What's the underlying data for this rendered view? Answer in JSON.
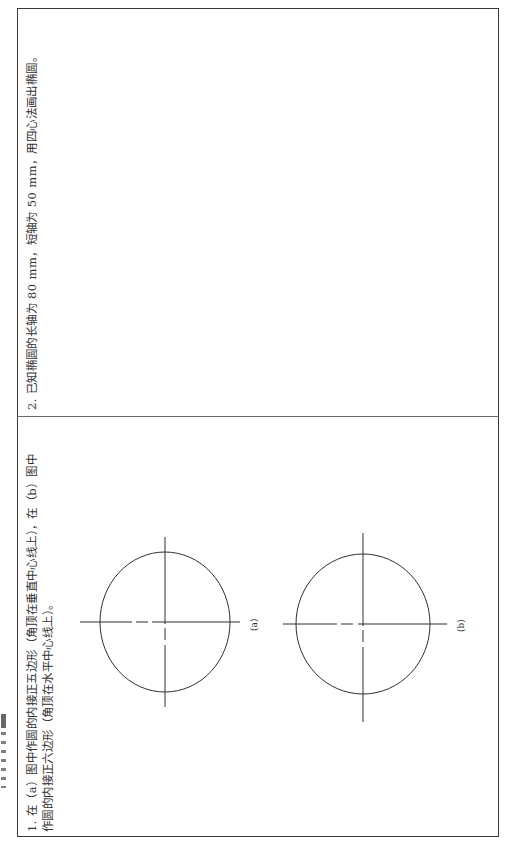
{
  "document": {
    "orientation": "rotated-90-ccw",
    "edge_fragment": "",
    "problems": [
      {
        "number": "1.",
        "lines": [
          "1. 在（a）图中作圆的内接正五边形（角顶在垂直中心线上），在（b）图中",
          "作圆的内接正六边形（角顶在水平中心线上）。"
        ],
        "figures": [
          {
            "label": "(a)",
            "shape": "circle",
            "center": [
              165,
              622
            ],
            "rx": 65,
            "ry": 70
          },
          {
            "label": "(b)",
            "shape": "circle",
            "center": [
              363,
              624
            ],
            "rx": 67,
            "ry": 70
          }
        ]
      },
      {
        "number": "2.",
        "lines": [
          "2. 已知椭圆的长轴为 80 mm，短轴为 50 mm，用四心法画出椭圆。"
        ],
        "figures": []
      }
    ]
  },
  "colors": {
    "line": "#2f2f2f",
    "frame": "#3a3a3a",
    "divider": "#6a6a6a",
    "text": "#333333"
  }
}
